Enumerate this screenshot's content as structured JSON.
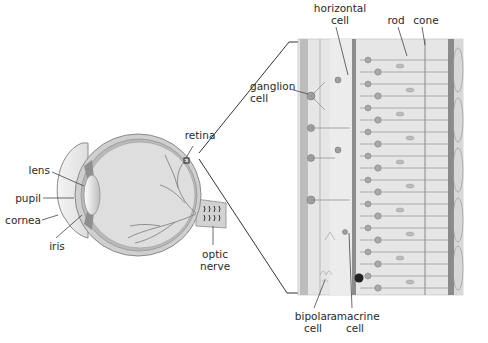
{
  "diagram": {
    "eye_labels": {
      "lens": "lens",
      "pupil": "pupil",
      "cornea": "cornea",
      "iris": "iris",
      "retina": "retina",
      "optic_nerve_line1": "optic",
      "optic_nerve_line2": "nerve"
    },
    "retina_labels": {
      "horizontal_line1": "horizontal",
      "horizontal_line2": "cell",
      "rod": "rod",
      "cone": "cone",
      "ganglion_line1": "ganglion",
      "ganglion_line2": "cell",
      "bipolar_line1": "bipolar",
      "bipolar_line2": "cell",
      "amacrine_line1": "amacrine",
      "amacrine_line2": "cell"
    },
    "colors": {
      "background": "#ffffff",
      "eye_fill": "#dcdcdc",
      "sclera": "#cfcfcf",
      "panel_bg": "#e6e6e6",
      "line": "#3a3a3a",
      "vessel": "#7a7a7a",
      "cell": "#9a9a9a"
    }
  }
}
